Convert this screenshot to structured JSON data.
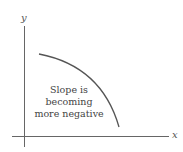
{
  "diagram": {
    "axes": {
      "x_label": "x",
      "y_label": "y"
    },
    "curve": {
      "description": "concave-down decreasing curve",
      "color": "#555555"
    },
    "annotation": {
      "lines": [
        "Slope is",
        "becoming",
        "more negative"
      ]
    }
  }
}
